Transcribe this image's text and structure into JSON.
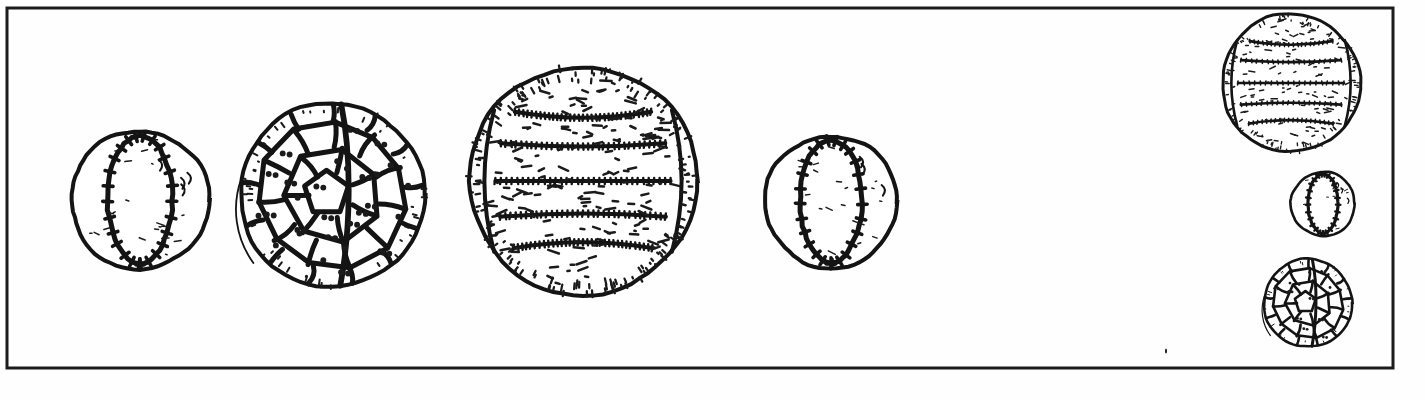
{
  "figure": {
    "caption": "",
    "background_color": "#fefefe",
    "ink_color": "#141414",
    "border": {
      "name": "outer-frame",
      "x": 7,
      "y": 8,
      "width": 1386,
      "height": 360,
      "stroke_width": 3,
      "color": "#1c1c1c"
    },
    "canvas": {
      "width": 1425,
      "height": 400
    }
  },
  "balls": [
    {
      "id": "baseball-1",
      "type": "baseball",
      "label": "Baseball",
      "row": "main",
      "order": 1,
      "cx": 140,
      "cy": 200,
      "r": 69,
      "stroke_width": 4,
      "seam_stroke": 5,
      "stitch_count": 17,
      "speckle": true
    },
    {
      "id": "soccer-ball-2",
      "type": "soccer",
      "label": "Soccer ball",
      "row": "main",
      "order": 2,
      "cx": 332,
      "cy": 195,
      "r": 92,
      "stroke_width": 4,
      "panel_stroke": 5,
      "panel_rings": [
        0.0,
        0.42,
        0.74,
        1.0
      ],
      "panel_counts": [
        5,
        9,
        12
      ],
      "speckle": true
    },
    {
      "id": "volleyball-3",
      "type": "volleyball",
      "label": "Volleyball",
      "row": "main",
      "order": 3,
      "cx": 583,
      "cy": 181,
      "r": 114,
      "stroke_width": 4,
      "band_stroke": 4,
      "band_count": 6,
      "side_panel_offset": 0.78,
      "speckle": true
    },
    {
      "id": "baseball-4",
      "type": "baseball",
      "label": "Baseball",
      "row": "main",
      "order": 4,
      "cx": 831,
      "cy": 202,
      "r": 66,
      "stroke_width": 4,
      "seam_stroke": 5,
      "stitch_count": 17,
      "speckle": true
    },
    {
      "id": "volleyball-5",
      "type": "volleyball",
      "label": "Volleyball",
      "row": "right-stack",
      "order": 1,
      "cx": 1291,
      "cy": 83,
      "r": 69,
      "stroke_width": 3,
      "band_stroke": 2.6,
      "band_count": 6,
      "side_panel_offset": 0.78,
      "speckle": true
    },
    {
      "id": "baseball-6",
      "type": "baseball",
      "label": "Baseball",
      "row": "right-stack",
      "order": 2,
      "cx": 1323,
      "cy": 204,
      "r": 32,
      "stroke_width": 2.6,
      "seam_stroke": 3.2,
      "stitch_count": 13,
      "speckle": true
    },
    {
      "id": "soccer-ball-7",
      "type": "soccer",
      "label": "Soccer ball",
      "row": "right-stack",
      "order": 3,
      "cx": 1308,
      "cy": 303,
      "r": 44,
      "stroke_width": 2.6,
      "panel_stroke": 2.6,
      "panel_rings": [
        0.0,
        0.42,
        0.74,
        1.0
      ],
      "panel_counts": [
        5,
        9,
        12
      ],
      "speckle": true
    }
  ],
  "marks": [
    {
      "id": "stray-speck",
      "name": "stray-ink-speck",
      "cx": 1166,
      "cy": 351,
      "w": 2,
      "h": 5
    }
  ],
  "counts": {
    "total_balls": 7,
    "main_row": 4,
    "right_stack": 3,
    "baseballs": 3,
    "soccer_balls": 2,
    "volleyballs": 2
  }
}
